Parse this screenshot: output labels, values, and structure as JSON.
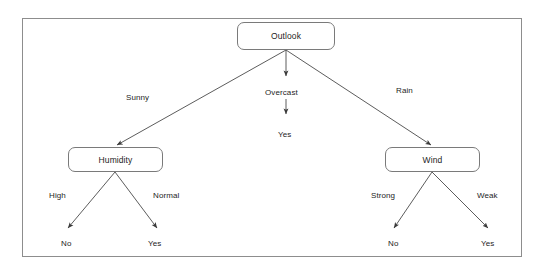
{
  "diagram": {
    "type": "decision-tree",
    "title": "",
    "colors": {
      "frame_stroke": "#8d8d8d",
      "node_stroke": "#7a7a7a",
      "node_fill": "#ffffff",
      "edge_stroke": "#4a4a4a",
      "text": "#1d1d1d",
      "background": "#ffffff"
    },
    "nodes": [
      {
        "id": "outlook",
        "label": "Outlook",
        "kind": "decision",
        "x": 237,
        "y": 22,
        "w": 98,
        "h": 28
      },
      {
        "id": "humidity",
        "label": "Humidity",
        "kind": "decision",
        "x": 68,
        "y": 147,
        "w": 95,
        "h": 25
      },
      {
        "id": "wind",
        "label": "Wind",
        "kind": "decision",
        "x": 385,
        "y": 147,
        "w": 95,
        "h": 25
      }
    ],
    "leaves": [
      {
        "id": "leaf-overcast-yes",
        "label": "Yes",
        "x": 278,
        "y": 130
      },
      {
        "id": "leaf-high-no",
        "label": "No",
        "x": 61,
        "y": 239
      },
      {
        "id": "leaf-normal-yes",
        "label": "Yes",
        "x": 148,
        "y": 239
      },
      {
        "id": "leaf-strong-no",
        "label": "No",
        "x": 388,
        "y": 239
      },
      {
        "id": "leaf-weak-yes",
        "label": "Yes",
        "x": 481,
        "y": 239
      }
    ],
    "edges": [
      {
        "id": "edge-outlook-sunny",
        "from": "outlook",
        "to": "humidity",
        "label": "Sunny",
        "label_x": 126,
        "label_y": 93
      },
      {
        "id": "edge-outlook-overcast",
        "from": "outlook",
        "to": "leaf-overcast-yes",
        "label": "Overcast",
        "label_x": 265,
        "label_y": 88
      },
      {
        "id": "edge-outlook-rain",
        "from": "outlook",
        "to": "wind",
        "label": "Rain",
        "label_x": 396,
        "label_y": 86
      },
      {
        "id": "edge-humidity-high",
        "from": "humidity",
        "to": "leaf-high-no",
        "label": "High",
        "label_x": 49,
        "label_y": 191
      },
      {
        "id": "edge-humidity-normal",
        "from": "humidity",
        "to": "leaf-normal-yes",
        "label": "Normal",
        "label_x": 153,
        "label_y": 191
      },
      {
        "id": "edge-wind-strong",
        "from": "wind",
        "to": "leaf-strong-no",
        "label": "Strong",
        "label_x": 371,
        "label_y": 191
      },
      {
        "id": "edge-wind-weak",
        "from": "wind",
        "to": "leaf-weak-yes",
        "label": "Weak",
        "label_x": 477,
        "label_y": 191
      }
    ]
  }
}
